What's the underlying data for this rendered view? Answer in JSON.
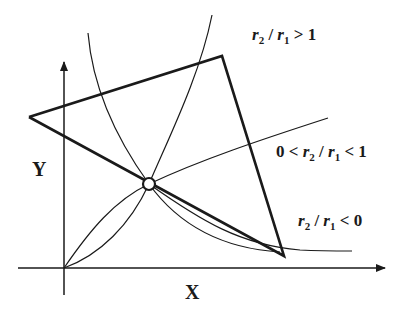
{
  "axes": {
    "x_label": "X",
    "y_label": "Y"
  },
  "curves": [
    {
      "id": "ratio-gt-1",
      "label_var_a": "r",
      "label_sub_a": "2",
      "label_sep": " / ",
      "label_var_b": "r",
      "label_sub_b": "1",
      "label_rel": " > 1"
    },
    {
      "id": "ratio-between-0-1",
      "label_prefix": "0 < ",
      "label_var_a": "r",
      "label_sub_a": "2",
      "label_sep": " / ",
      "label_var_b": "r",
      "label_sub_b": "1",
      "label_rel": " < 1"
    },
    {
      "id": "ratio-lt-0",
      "label_var_a": "r",
      "label_sub_a": "2",
      "label_sep": " / ",
      "label_var_b": "r",
      "label_sub_b": "1",
      "label_rel": " < 0"
    }
  ],
  "colors": {
    "line": "#1a1a1a",
    "background": "#ffffff"
  }
}
